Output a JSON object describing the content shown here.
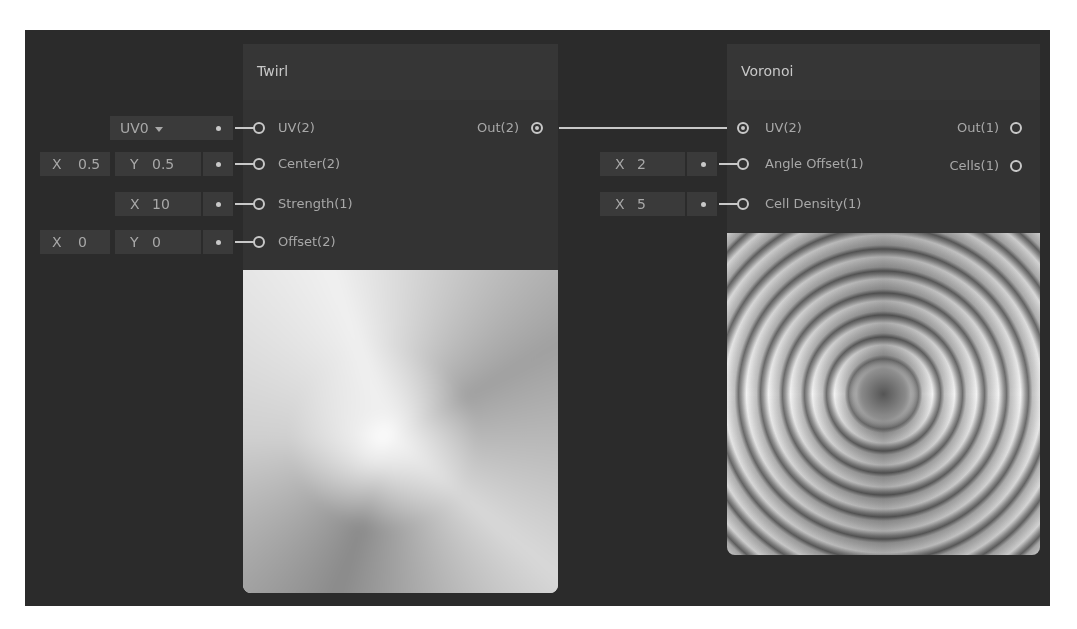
{
  "nodes": {
    "twirl": {
      "title": "Twirl",
      "inputs": [
        {
          "label": "UV(2)",
          "control": {
            "type": "dropdown",
            "value": "UV0"
          }
        },
        {
          "label": "Center(2)",
          "control": {
            "type": "vector2",
            "x_label": "X",
            "x": "0.5",
            "y_label": "Y",
            "y": "0.5"
          }
        },
        {
          "label": "Strength(1)",
          "control": {
            "type": "vector1",
            "x_label": "X",
            "x": "10"
          }
        },
        {
          "label": "Offset(2)",
          "control": {
            "type": "vector2",
            "x_label": "X",
            "x": "0",
            "y_label": "Y",
            "y": "0"
          }
        }
      ],
      "outputs": [
        {
          "label": "Out(2)",
          "connected": true
        }
      ],
      "preview": "twirl-gradient-preview"
    },
    "voronoi": {
      "title": "Voronoi",
      "inputs": [
        {
          "label": "UV(2)",
          "connected": true
        },
        {
          "label": "Angle Offset(1)",
          "control": {
            "type": "vector1",
            "x_label": "X",
            "x": "2"
          }
        },
        {
          "label": "Cell Density(1)",
          "control": {
            "type": "vector1",
            "x_label": "X",
            "x": "5"
          }
        }
      ],
      "outputs": [
        {
          "label": "Out(1)",
          "connected": false
        },
        {
          "label": "Cells(1)",
          "connected": false
        }
      ],
      "preview": "voronoi-swirl-preview"
    }
  },
  "edges": [
    {
      "from": "Twirl.Out(2)",
      "to": "Voronoi.UV(2)"
    }
  ],
  "colors": {
    "canvas": "#2b2b2b",
    "node": "#333333",
    "header": "#363636",
    "field": "#3a3a3a",
    "text": "#a8a8a8",
    "wire": "#c8c8c8"
  }
}
